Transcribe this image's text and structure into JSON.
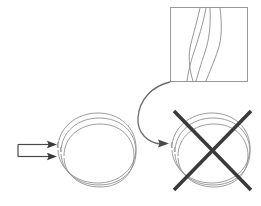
{
  "figure": {
    "canvas": {
      "width": 261,
      "height": 206,
      "background": "#ffffff"
    },
    "colors": {
      "thin_line": "#7a7a7a",
      "box_border": "#9a9a9a",
      "arrow_dark": "#4a4a4a",
      "cross_out": "#3a3a3a",
      "background": "#ffffff"
    },
    "elements": {
      "inset_box": {
        "name": "magnified-inset-box",
        "x": 170,
        "y": 7,
        "width": 78,
        "height": 75,
        "stroke": "#9a9a9a",
        "stroke_width": 1,
        "fill": "#ffffff",
        "curve_count": 4
      },
      "left_ring": {
        "name": "coiled-ring-intact",
        "center_x": 98,
        "center_y": 150,
        "radius_x": 34,
        "radius_y": 35,
        "turns": 3,
        "stroke": "#7a7a7a"
      },
      "right_ring": {
        "name": "coiled-ring-crossed-out",
        "center_x": 211,
        "center_y": 150,
        "radius_x": 34,
        "radius_y": 35,
        "turns": 3,
        "stroke": "#7a7a7a"
      },
      "cross_out": {
        "name": "cross-out-x-mark",
        "stroke": "#3a3a3a",
        "stroke_width": 4,
        "x1": 175,
        "y1": 112,
        "x2": 250,
        "y2": 190,
        "x3": 250,
        "y3": 112,
        "x4": 175,
        "y4": 190
      },
      "incoming_arrows": {
        "name": "incoming-beam-arrows",
        "count": 2,
        "stroke": "#4a4a4a",
        "arrow_top": {
          "x1": 18,
          "y1": 144,
          "x2": 52,
          "y2": 144
        },
        "arrow_bottom": {
          "x1": 18,
          "y1": 156,
          "x2": 52,
          "y2": 156
        }
      },
      "curved_arrow": {
        "name": "zoom-callout-curved-arrow",
        "stroke": "#6a6a6a",
        "stroke_width": 1.4,
        "start_x": 170,
        "start_y": 82,
        "end_x": 168,
        "end_y": 144
      }
    }
  }
}
